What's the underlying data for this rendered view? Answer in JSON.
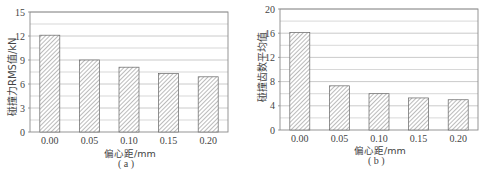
{
  "chart_data": [
    {
      "type": "bar",
      "panel_label": "( a )",
      "title": "",
      "xlabel": "偏心距/mm",
      "ylabel": "碰撞力RMS值/kN",
      "categories": [
        "0.00",
        "0.05",
        "0.10",
        "0.15",
        "0.20"
      ],
      "values": [
        12.1,
        9.0,
        8.1,
        7.3,
        6.9
      ],
      "ylim": [
        0,
        15
      ],
      "yticks": [
        "0",
        "3",
        "6",
        "9",
        "12",
        "15"
      ],
      "grid": true,
      "minor_grid": true,
      "bar_pattern": "diagonal-hatch",
      "legend": null
    },
    {
      "type": "bar",
      "panel_label": "( b )",
      "title": "",
      "xlabel": "偏心距/mm",
      "ylabel": "碰撞齿数平均值",
      "categories": [
        "0.00",
        "0.05",
        "0.10",
        "0.15",
        "0.20"
      ],
      "values": [
        16.1,
        7.3,
        6.0,
        5.3,
        5.0
      ],
      "ylim": [
        0,
        20
      ],
      "yticks": [
        "0",
        "4",
        "8",
        "12",
        "16",
        "20"
      ],
      "grid": true,
      "minor_grid": true,
      "bar_pattern": "diagonal-hatch",
      "legend": null
    }
  ],
  "colors": {
    "grid": "#bdbdbd",
    "axis": "#8a8a8a",
    "bar_edge": "#666666",
    "hatch": "#777777"
  }
}
